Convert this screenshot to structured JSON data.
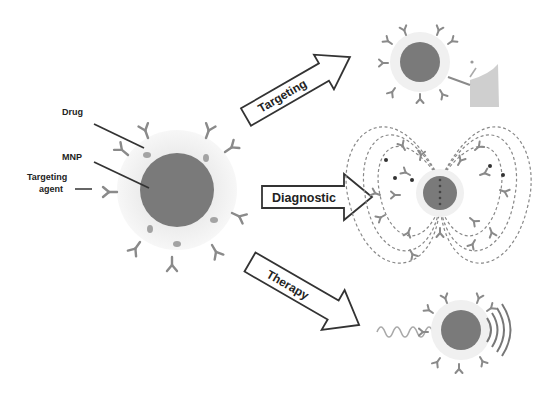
{
  "diagram": {
    "labels": {
      "drug": "Drug",
      "mnp": "MNP",
      "targeting_agent_line1": "Targeting",
      "targeting_agent_line2": "agent"
    },
    "arrows": [
      {
        "id": "targeting",
        "label": "Targeting"
      },
      {
        "id": "diagnostic",
        "label": "Diagnostic"
      },
      {
        "id": "therapy",
        "label": "Therapy"
      }
    ],
    "colors": {
      "core": "#7a7a7a",
      "shell": "#ededed",
      "antibody": "#8a8a8a",
      "drug": "#a0a0a0",
      "arrow_stroke": "#333333",
      "field_lines": "#888888",
      "cell": "#cfcfcf"
    }
  }
}
